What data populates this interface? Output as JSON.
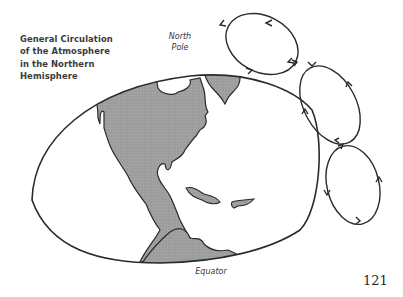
{
  "figure": {
    "caption_lines": [
      "General Circulation",
      "of the Atmosphere",
      "in the Northern",
      "Hemisphere"
    ],
    "labels": {
      "north_pole_line1": "North",
      "north_pole_line2": "Pole",
      "equator": "Equator"
    },
    "circulation_cells": [
      {
        "name": "polar-cell",
        "direction": "counterclockwise"
      },
      {
        "name": "mid-latitude-cell",
        "direction": "clockwise"
      },
      {
        "name": "tropical-cell",
        "direction": "counterclockwise"
      }
    ],
    "colors": {
      "land": "#9a9a9a",
      "outline": "#2a2a2a",
      "background": "#ffffff"
    }
  },
  "page": {
    "number": "121"
  }
}
